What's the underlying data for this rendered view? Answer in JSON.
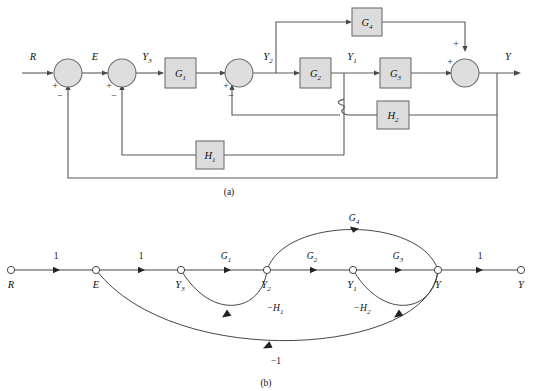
{
  "figure": {
    "panel_a": {
      "caption": "(a)",
      "type": "block-diagram",
      "signals": {
        "input": "R",
        "error": "E",
        "y3": "Y3",
        "y2": "Y2",
        "y1": "Y1",
        "output": "Y"
      },
      "signal_labels": [
        {
          "base": "R",
          "sub": ""
        },
        {
          "base": "E",
          "sub": ""
        },
        {
          "base": "Y",
          "sub": "3"
        },
        {
          "base": "Y",
          "sub": "2"
        },
        {
          "base": "Y",
          "sub": "1"
        },
        {
          "base": "Y",
          "sub": ""
        }
      ],
      "blocks": [
        {
          "base": "G",
          "sub": "1",
          "name": "block-g1"
        },
        {
          "base": "G",
          "sub": "2",
          "name": "block-g2"
        },
        {
          "base": "G",
          "sub": "3",
          "name": "block-g3"
        },
        {
          "base": "G",
          "sub": "4",
          "name": "block-g4"
        },
        {
          "base": "H",
          "sub": "1",
          "name": "block-h1"
        },
        {
          "base": "H",
          "sub": "2",
          "name": "block-h2"
        }
      ],
      "summing_junctions": [
        {
          "name": "summer-1",
          "signs": [
            "+",
            "-"
          ]
        },
        {
          "name": "summer-2",
          "signs": [
            "+",
            "-"
          ]
        },
        {
          "name": "summer-3",
          "signs": [
            "+",
            "-"
          ]
        },
        {
          "name": "summer-4",
          "signs": [
            "+",
            "+"
          ]
        }
      ],
      "signs": {
        "plus": "+",
        "minus": "−"
      }
    },
    "panel_b": {
      "caption": "(b)",
      "type": "signal-flow-graph",
      "nodes": [
        {
          "id": "R",
          "base": "R",
          "sub": "",
          "x": 11
        },
        {
          "id": "E",
          "base": "E",
          "sub": "",
          "x": 96
        },
        {
          "id": "Y3",
          "base": "Y",
          "sub": "3",
          "x": 181
        },
        {
          "id": "Y2",
          "base": "Y",
          "sub": "2",
          "x": 267
        },
        {
          "id": "Y1",
          "base": "Y",
          "sub": "1",
          "x": 353
        },
        {
          "id": "Yc",
          "base": "Y",
          "sub": "",
          "x": 438
        },
        {
          "id": "Yout",
          "base": "Y",
          "sub": "",
          "x": 521
        }
      ],
      "branch_gains": [
        {
          "label": "1",
          "base": "1",
          "sub": "",
          "from": "R",
          "to": "E"
        },
        {
          "label": "1",
          "base": "1",
          "sub": "",
          "from": "E",
          "to": "Y3"
        },
        {
          "label": "G1",
          "base": "G",
          "sub": "1",
          "from": "Y3",
          "to": "Y2"
        },
        {
          "label": "G2",
          "base": "G",
          "sub": "2",
          "from": "Y2",
          "to": "Y1"
        },
        {
          "label": "G3",
          "base": "G",
          "sub": "3",
          "from": "Y1",
          "to": "Y"
        },
        {
          "label": "1",
          "base": "1",
          "sub": "",
          "from": "Y",
          "to": "Yout"
        },
        {
          "label": "G4",
          "base": "G",
          "sub": "4",
          "from": "Y2",
          "to": "Y"
        },
        {
          "label": "-H1",
          "base": "−H",
          "sub": "1",
          "from": "Y2",
          "to": "Y3"
        },
        {
          "label": "-H2",
          "base": "−H",
          "sub": "2",
          "from": "Y",
          "to": "Y1"
        },
        {
          "label": "-1",
          "base": "−1",
          "sub": "",
          "from": "Y",
          "to": "E"
        }
      ]
    }
  }
}
